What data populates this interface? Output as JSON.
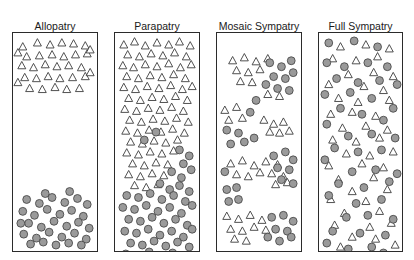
{
  "figure": {
    "background_color": "#ffffff",
    "symbols": {
      "triangle": {
        "name": "species-a-triangle",
        "fill": "#ffffff",
        "stroke": "#3a3a3a",
        "size": 7.4
      },
      "circle": {
        "name": "species-b-circle",
        "fill": "#9a9a9a",
        "stroke": "#4a4a4a",
        "radius": 4.0
      }
    },
    "panel_border_color": "#2b2b2b"
  },
  "panels": [
    {
      "id": "allopatry",
      "title": "Allopatry",
      "left": 12,
      "top": 20,
      "width": 86,
      "box_top": 32,
      "box_height": 220,
      "triangles": [
        [
          10,
          14
        ],
        [
          25,
          10
        ],
        [
          38,
          12
        ],
        [
          50,
          10
        ],
        [
          62,
          11
        ],
        [
          74,
          13
        ],
        [
          14,
          24
        ],
        [
          27,
          23
        ],
        [
          40,
          22
        ],
        [
          52,
          24
        ],
        [
          64,
          22
        ],
        [
          76,
          21
        ],
        [
          9,
          33
        ],
        [
          21,
          35
        ],
        [
          33,
          32
        ],
        [
          45,
          34
        ],
        [
          57,
          33
        ],
        [
          70,
          35
        ],
        [
          12,
          45
        ],
        [
          24,
          46
        ],
        [
          36,
          44
        ],
        [
          48,
          46
        ],
        [
          61,
          45
        ],
        [
          74,
          44
        ],
        [
          17,
          56
        ],
        [
          30,
          57
        ],
        [
          43,
          55
        ],
        [
          55,
          57
        ],
        [
          68,
          56
        ],
        [
          79,
          17
        ],
        [
          79,
          40
        ],
        [
          5,
          20
        ],
        [
          5,
          50
        ]
      ],
      "circles": [
        [
          14,
          168
        ],
        [
          27,
          172
        ],
        [
          40,
          166
        ],
        [
          53,
          171
        ],
        [
          66,
          167
        ],
        [
          76,
          173
        ],
        [
          10,
          180
        ],
        [
          22,
          184
        ],
        [
          35,
          178
        ],
        [
          48,
          183
        ],
        [
          60,
          179
        ],
        [
          72,
          185
        ],
        [
          16,
          192
        ],
        [
          29,
          196
        ],
        [
          42,
          190
        ],
        [
          55,
          195
        ],
        [
          67,
          191
        ],
        [
          78,
          197
        ],
        [
          11,
          203
        ],
        [
          24,
          207
        ],
        [
          37,
          201
        ],
        [
          50,
          206
        ],
        [
          63,
          202
        ],
        [
          75,
          208
        ],
        [
          18,
          213
        ],
        [
          31,
          211
        ],
        [
          44,
          214
        ],
        [
          57,
          212
        ],
        [
          70,
          214
        ],
        [
          8,
          192
        ],
        [
          33,
          162
        ],
        [
          58,
          160
        ]
      ]
    },
    {
      "id": "parapatry",
      "title": "Parapatry",
      "left": 114,
      "top": 20,
      "width": 86,
      "box_top": 32,
      "box_height": 220,
      "triangles": [
        [
          9,
          12
        ],
        [
          20,
          9
        ],
        [
          31,
          13
        ],
        [
          43,
          10
        ],
        [
          55,
          12
        ],
        [
          66,
          9
        ],
        [
          77,
          13
        ],
        [
          13,
          22
        ],
        [
          25,
          24
        ],
        [
          37,
          21
        ],
        [
          49,
          23
        ],
        [
          61,
          20
        ],
        [
          73,
          24
        ],
        [
          8,
          33
        ],
        [
          19,
          35
        ],
        [
          31,
          32
        ],
        [
          43,
          34
        ],
        [
          55,
          31
        ],
        [
          67,
          35
        ],
        [
          78,
          32
        ],
        [
          12,
          44
        ],
        [
          24,
          46
        ],
        [
          36,
          43
        ],
        [
          48,
          45
        ],
        [
          60,
          42
        ],
        [
          72,
          46
        ],
        [
          9,
          55
        ],
        [
          21,
          57
        ],
        [
          33,
          54
        ],
        [
          45,
          56
        ],
        [
          57,
          53
        ],
        [
          69,
          57
        ],
        [
          79,
          54
        ],
        [
          14,
          66
        ],
        [
          26,
          68
        ],
        [
          38,
          65
        ],
        [
          50,
          67
        ],
        [
          62,
          64
        ],
        [
          74,
          68
        ],
        [
          10,
          77
        ],
        [
          22,
          79
        ],
        [
          34,
          76
        ],
        [
          46,
          78
        ],
        [
          58,
          75
        ],
        [
          70,
          79
        ],
        [
          15,
          88
        ],
        [
          27,
          90
        ],
        [
          39,
          87
        ],
        [
          51,
          89
        ],
        [
          63,
          86
        ],
        [
          75,
          90
        ],
        [
          11,
          99
        ],
        [
          23,
          101
        ],
        [
          35,
          98
        ],
        [
          47,
          100
        ],
        [
          59,
          97
        ],
        [
          71,
          101
        ],
        [
          16,
          110
        ],
        [
          28,
          112
        ],
        [
          40,
          109
        ],
        [
          52,
          111
        ],
        [
          64,
          108
        ],
        [
          12,
          121
        ],
        [
          24,
          123
        ],
        [
          36,
          120
        ],
        [
          48,
          122
        ],
        [
          60,
          119
        ],
        [
          18,
          132
        ],
        [
          30,
          134
        ],
        [
          42,
          131
        ],
        [
          54,
          133
        ],
        [
          14,
          143
        ],
        [
          26,
          145
        ],
        [
          38,
          142
        ],
        [
          50,
          144
        ],
        [
          20,
          154
        ],
        [
          32,
          156
        ],
        [
          44,
          153
        ]
      ],
      "circles": [
        [
          66,
          118
        ],
        [
          76,
          124
        ],
        [
          70,
          132
        ],
        [
          58,
          140
        ],
        [
          68,
          146
        ],
        [
          78,
          138
        ],
        [
          46,
          152
        ],
        [
          56,
          158
        ],
        [
          66,
          154
        ],
        [
          76,
          160
        ],
        [
          12,
          164
        ],
        [
          24,
          166
        ],
        [
          36,
          162
        ],
        [
          48,
          168
        ],
        [
          60,
          164
        ],
        [
          72,
          170
        ],
        [
          8,
          176
        ],
        [
          20,
          178
        ],
        [
          32,
          174
        ],
        [
          44,
          180
        ],
        [
          56,
          176
        ],
        [
          68,
          182
        ],
        [
          79,
          174
        ],
        [
          14,
          188
        ],
        [
          26,
          190
        ],
        [
          38,
          186
        ],
        [
          50,
          192
        ],
        [
          62,
          188
        ],
        [
          74,
          194
        ],
        [
          10,
          200
        ],
        [
          22,
          202
        ],
        [
          34,
          198
        ],
        [
          46,
          204
        ],
        [
          58,
          200
        ],
        [
          70,
          206
        ],
        [
          79,
          198
        ],
        [
          16,
          212
        ],
        [
          28,
          214
        ],
        [
          40,
          210
        ],
        [
          52,
          215
        ],
        [
          64,
          211
        ],
        [
          76,
          216
        ],
        [
          11,
          223
        ],
        [
          23,
          225
        ],
        [
          35,
          221
        ],
        [
          47,
          226
        ],
        [
          59,
          222
        ],
        [
          71,
          227
        ],
        [
          18,
          234
        ],
        [
          30,
          236
        ],
        [
          42,
          233
        ],
        [
          54,
          235
        ],
        [
          66,
          232
        ],
        [
          77,
          236
        ],
        [
          13,
          245
        ],
        [
          25,
          247
        ],
        [
          37,
          244
        ],
        [
          49,
          246
        ],
        [
          61,
          243
        ],
        [
          73,
          247
        ],
        [
          30,
          108
        ],
        [
          42,
          100
        ]
      ]
    },
    {
      "id": "mosaic-sympatry",
      "title": "Mosaic Sympatry",
      "left": 216,
      "top": 20,
      "width": 86,
      "box_top": 32,
      "box_height": 220,
      "triangles": [
        [
          16,
          28
        ],
        [
          28,
          25
        ],
        [
          40,
          29
        ],
        [
          52,
          26
        ],
        [
          20,
          38
        ],
        [
          32,
          40
        ],
        [
          44,
          37
        ],
        [
          24,
          49
        ],
        [
          36,
          50
        ],
        [
          8,
          78
        ],
        [
          20,
          75
        ],
        [
          12,
          88
        ],
        [
          26,
          86
        ],
        [
          52,
          62
        ],
        [
          64,
          64
        ],
        [
          48,
          88
        ],
        [
          58,
          92
        ],
        [
          68,
          90
        ],
        [
          54,
          100
        ],
        [
          64,
          101
        ],
        [
          74,
          99
        ],
        [
          14,
          132
        ],
        [
          26,
          129
        ],
        [
          38,
          134
        ],
        [
          20,
          143
        ],
        [
          32,
          145
        ],
        [
          44,
          141
        ],
        [
          50,
          130
        ],
        [
          62,
          133
        ],
        [
          56,
          142
        ],
        [
          68,
          145
        ],
        [
          60,
          153
        ],
        [
          72,
          151
        ],
        [
          10,
          185
        ],
        [
          22,
          188
        ],
        [
          34,
          184
        ],
        [
          46,
          189
        ],
        [
          14,
          198
        ],
        [
          26,
          200
        ],
        [
          38,
          196
        ],
        [
          50,
          199
        ],
        [
          18,
          208
        ],
        [
          30,
          210
        ]
      ],
      "circles": [
        [
          54,
          30
        ],
        [
          66,
          34
        ],
        [
          76,
          28
        ],
        [
          58,
          44
        ],
        [
          70,
          46
        ],
        [
          78,
          40
        ],
        [
          62,
          56
        ],
        [
          74,
          58
        ],
        [
          50,
          52
        ],
        [
          40,
          68
        ],
        [
          34,
          80
        ],
        [
          10,
          98
        ],
        [
          22,
          101
        ],
        [
          14,
          112
        ],
        [
          28,
          110
        ],
        [
          38,
          106
        ],
        [
          58,
          124
        ],
        [
          70,
          120
        ],
        [
          78,
          128
        ],
        [
          62,
          136
        ],
        [
          74,
          138
        ],
        [
          66,
          148
        ],
        [
          78,
          152
        ],
        [
          8,
          140
        ],
        [
          20,
          156
        ],
        [
          10,
          158
        ],
        [
          22,
          168
        ],
        [
          12,
          170
        ],
        [
          56,
          186
        ],
        [
          68,
          184
        ],
        [
          78,
          190
        ],
        [
          60,
          198
        ],
        [
          72,
          200
        ],
        [
          64,
          210
        ],
        [
          76,
          206
        ],
        [
          52,
          206
        ]
      ]
    },
    {
      "id": "full-sympatry",
      "title": "Full Sympatry",
      "left": 318,
      "top": 20,
      "width": 85,
      "box_top": 32,
      "box_height": 220,
      "triangles": [
        [
          22,
          14
        ],
        [
          48,
          12
        ],
        [
          72,
          16
        ],
        [
          14,
          26
        ],
        [
          38,
          28
        ],
        [
          60,
          24
        ],
        [
          30,
          42
        ],
        [
          56,
          40
        ],
        [
          76,
          44
        ],
        [
          10,
          52
        ],
        [
          46,
          54
        ],
        [
          66,
          58
        ],
        [
          20,
          66
        ],
        [
          40,
          70
        ],
        [
          72,
          68
        ],
        [
          12,
          82
        ],
        [
          34,
          80
        ],
        [
          58,
          84
        ],
        [
          24,
          96
        ],
        [
          48,
          94
        ],
        [
          70,
          98
        ],
        [
          14,
          108
        ],
        [
          38,
          110
        ],
        [
          62,
          106
        ],
        [
          28,
          122
        ],
        [
          52,
          124
        ],
        [
          76,
          120
        ],
        [
          10,
          134
        ],
        [
          44,
          132
        ],
        [
          66,
          136
        ],
        [
          20,
          148
        ],
        [
          56,
          146
        ],
        [
          34,
          160
        ],
        [
          70,
          158
        ],
        [
          12,
          168
        ],
        [
          48,
          170
        ],
        [
          26,
          182
        ],
        [
          62,
          180
        ],
        [
          16,
          194
        ],
        [
          52,
          196
        ],
        [
          74,
          192
        ],
        [
          34,
          206
        ],
        [
          58,
          208
        ],
        [
          22,
          216
        ],
        [
          78,
          214
        ]
      ],
      "circles": [
        [
          10,
          10
        ],
        [
          36,
          8
        ],
        [
          60,
          14
        ],
        [
          8,
          30
        ],
        [
          26,
          34
        ],
        [
          50,
          30
        ],
        [
          70,
          34
        ],
        [
          18,
          46
        ],
        [
          40,
          50
        ],
        [
          62,
          48
        ],
        [
          80,
          52
        ],
        [
          6,
          62
        ],
        [
          32,
          60
        ],
        [
          54,
          66
        ],
        [
          76,
          76
        ],
        [
          22,
          76
        ],
        [
          44,
          82
        ],
        [
          66,
          88
        ],
        [
          8,
          92
        ],
        [
          30,
          104
        ],
        [
          54,
          102
        ],
        [
          78,
          106
        ],
        [
          16,
          116
        ],
        [
          40,
          120
        ],
        [
          64,
          118
        ],
        [
          6,
          128
        ],
        [
          34,
          140
        ],
        [
          58,
          138
        ],
        [
          80,
          142
        ],
        [
          20,
          152
        ],
        [
          46,
          156
        ],
        [
          72,
          150
        ],
        [
          10,
          164
        ],
        [
          38,
          172
        ],
        [
          64,
          168
        ],
        [
          28,
          186
        ],
        [
          50,
          184
        ],
        [
          76,
          188
        ],
        [
          14,
          200
        ],
        [
          42,
          202
        ],
        [
          68,
          204
        ],
        [
          30,
          218
        ],
        [
          54,
          216
        ],
        [
          8,
          212
        ],
        [
          66,
          222
        ]
      ]
    }
  ]
}
